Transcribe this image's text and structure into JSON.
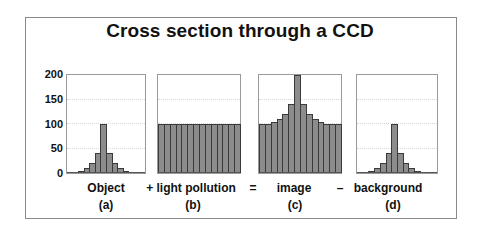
{
  "chart_data": [
    {
      "type": "bar",
      "panel": "a",
      "label": "Object",
      "sublabel": "(a)",
      "categories": [
        1,
        2,
        3,
        4,
        5,
        6,
        7,
        8,
        9,
        10,
        11,
        12,
        13,
        14
      ],
      "values": [
        0,
        0,
        5,
        10,
        20,
        40,
        100,
        40,
        20,
        10,
        5,
        0,
        0,
        0
      ],
      "ylim": [
        0,
        200
      ]
    },
    {
      "type": "bar",
      "panel": "b",
      "label": "+ light pollution",
      "sublabel": "(b)",
      "categories": [
        1,
        2,
        3,
        4,
        5,
        6,
        7,
        8,
        9,
        10,
        11,
        12,
        13,
        14
      ],
      "values": [
        100,
        100,
        100,
        100,
        100,
        100,
        100,
        100,
        100,
        100,
        100,
        100,
        100,
        100
      ],
      "ylim": [
        0,
        200
      ]
    },
    {
      "type": "bar",
      "panel": "c",
      "label": "image",
      "sublabel": "(c)",
      "categories": [
        1,
        2,
        3,
        4,
        5,
        6,
        7,
        8,
        9,
        10,
        11,
        12,
        13,
        14
      ],
      "values": [
        100,
        100,
        105,
        110,
        120,
        140,
        200,
        140,
        120,
        110,
        105,
        100,
        100,
        100
      ],
      "ylim": [
        0,
        200
      ]
    },
    {
      "type": "bar",
      "panel": "d",
      "label": "background",
      "sublabel": "(d)",
      "categories": [
        1,
        2,
        3,
        4,
        5,
        6,
        7,
        8,
        9,
        10,
        11,
        12,
        13,
        14
      ],
      "values": [
        0,
        0,
        5,
        10,
        20,
        40,
        100,
        40,
        20,
        10,
        5,
        0,
        0,
        0
      ],
      "ylim": [
        0,
        200
      ]
    }
  ],
  "title": "Cross section through a CCD",
  "yaxis": {
    "ticks": [
      "200",
      "150",
      "100",
      "50",
      "0"
    ],
    "min": 0,
    "max": 200,
    "grid": true
  },
  "operators": {
    "plus": "+",
    "equals": "=",
    "minus": "–"
  },
  "labels": {
    "a": "Object",
    "a_sub": "(a)",
    "b": "+ light pollution",
    "b_sub": "(b)",
    "eq": "=",
    "c": "image",
    "c_sub": "(c)",
    "minus": "–",
    "d": "background",
    "d_sub": "(d)"
  },
  "colors": {
    "bar_fill": "#8c8c8c",
    "bar_edge": "#3a3a3a",
    "frame": "#8a8a8a",
    "grid": "#d8d8d8"
  }
}
